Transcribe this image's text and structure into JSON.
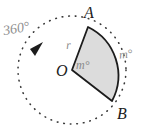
{
  "figure": {
    "type": "circle-sector-arc-diagram",
    "background_color": "#ffffff",
    "sector": {
      "fill_color": "#dcdcdc",
      "stroke_color": "#1c1c1c"
    },
    "circle": {
      "style": "dashed",
      "stroke_color": "#3a3a3a",
      "center_label": "O",
      "radius_px": 54
    }
  },
  "labels": {
    "point_a": "A",
    "point_b": "B",
    "center_o": "O",
    "radius": "r",
    "central_angle": "m°",
    "arc_measure": "m°",
    "full_rotation": "360°"
  },
  "colors": {
    "point_label": "#1c1c1c",
    "measure_label": "#8a8a8a",
    "rotation_label": "#8f8f8f",
    "sector_fill": "#dcdcdc",
    "outline": "#1c1c1c",
    "dashed_circle": "#3a3a3a"
  }
}
